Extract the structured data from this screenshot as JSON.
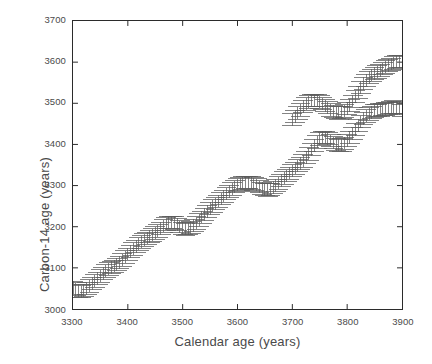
{
  "chart_data": {
    "type": "scatter",
    "title": "",
    "subtitle": "",
    "xlabel": "Calendar age (years)",
    "ylabel": "Carbon-14 age (years)",
    "xlim": [
      3300,
      3900
    ],
    "ylim": [
      3000,
      3700
    ],
    "xticks": [
      3300,
      3400,
      3500,
      3600,
      3700,
      3800,
      3900
    ],
    "yticks": [
      3000,
      3100,
      3200,
      3300,
      3400,
      3500,
      3600,
      3700
    ],
    "xtick_labels": [
      "3300",
      "3400",
      "3500",
      "3600",
      "3700",
      "3800",
      "3900"
    ],
    "ytick_labels": [
      "3000",
      "3100",
      "3200",
      "3300",
      "3400",
      "3500",
      "3600",
      "3700"
    ],
    "grid": false,
    "legend": null,
    "legend_position": "none",
    "marker_style": "errorbar-vertical-capped",
    "series_color": "#5a5a5a",
    "axis_color": "#2b2b2b",
    "background_color": "#ffffff",
    "error_bar_halfwidth_years": 18,
    "sample_spacing_years": 5,
    "series": [
      {
        "name": "Radiocarbon calibration measurements",
        "x": [
          3300,
          3305,
          3310,
          3315,
          3320,
          3325,
          3330,
          3335,
          3340,
          3345,
          3350,
          3355,
          3360,
          3365,
          3370,
          3375,
          3380,
          3385,
          3390,
          3395,
          3400,
          3405,
          3410,
          3415,
          3420,
          3425,
          3430,
          3435,
          3440,
          3445,
          3450,
          3455,
          3460,
          3465,
          3470,
          3475,
          3480,
          3485,
          3490,
          3495,
          3500,
          3505,
          3510,
          3515,
          3520,
          3525,
          3530,
          3535,
          3540,
          3545,
          3550,
          3555,
          3560,
          3565,
          3570,
          3575,
          3580,
          3585,
          3590,
          3595,
          3600,
          3605,
          3610,
          3615,
          3620,
          3625,
          3630,
          3635,
          3640,
          3645,
          3650,
          3655,
          3660,
          3665,
          3670,
          3675,
          3680,
          3685,
          3690,
          3695,
          3700,
          3705,
          3710,
          3715,
          3720,
          3725,
          3730,
          3735,
          3740,
          3745,
          3750,
          3755,
          3760,
          3765,
          3770,
          3775,
          3780,
          3785,
          3790,
          3795,
          3800,
          3805,
          3810,
          3815,
          3820,
          3825,
          3830,
          3835,
          3840,
          3845,
          3850,
          3855,
          3860,
          3865,
          3870,
          3875,
          3880,
          3885,
          3890,
          3895,
          3900
        ],
        "y": [
          3052,
          3048,
          3044,
          3042,
          3045,
          3050,
          3056,
          3062,
          3068,
          3074,
          3080,
          3086,
          3092,
          3097,
          3101,
          3104,
          3108,
          3113,
          3119,
          3126,
          3133,
          3140,
          3146,
          3152,
          3158,
          3163,
          3168,
          3172,
          3176,
          3180,
          3185,
          3190,
          3196,
          3202,
          3207,
          3210,
          3211,
          3209,
          3205,
          3200,
          3196,
          3194,
          3195,
          3198,
          3203,
          3209,
          3216,
          3223,
          3230,
          3237,
          3244,
          3250,
          3256,
          3262,
          3268,
          3274,
          3280,
          3286,
          3292,
          3297,
          3301,
          3304,
          3306,
          3307,
          3307,
          3306,
          3304,
          3301,
          3297,
          3293,
          3290,
          3289,
          3291,
          3295,
          3300,
          3306,
          3312,
          3318,
          3324,
          3330,
          3336,
          3342,
          3348,
          3354,
          3360,
          3368,
          3377,
          3387,
          3397,
          3406,
          3413,
          3417,
          3417,
          3414,
          3409,
          3404,
          3400,
          3398,
          3399,
          3403,
          3409,
          3417,
          3426,
          3436,
          3446,
          3455,
          3463,
          3469,
          3474,
          3478,
          3481,
          3483,
          3484,
          3485,
          3486,
          3488,
          3490,
          3491,
          3490,
          3487,
          3483
        ],
        "yerr": [
          16,
          16,
          16,
          15,
          15,
          15,
          15,
          15,
          15,
          15,
          15,
          15,
          15,
          15,
          15,
          15,
          15,
          15,
          15,
          15,
          15,
          15,
          15,
          15,
          15,
          15,
          15,
          15,
          15,
          15,
          15,
          15,
          15,
          15,
          15,
          15,
          15,
          15,
          15,
          15,
          15,
          15,
          15,
          15,
          15,
          15,
          15,
          15,
          15,
          15,
          15,
          15,
          15,
          15,
          15,
          15,
          15,
          15,
          15,
          15,
          15,
          15,
          15,
          15,
          15,
          15,
          15,
          15,
          15,
          15,
          15,
          15,
          15,
          15,
          15,
          15,
          15,
          15,
          15,
          15,
          15,
          15,
          15,
          15,
          15,
          15,
          15,
          15,
          15,
          15,
          15,
          15,
          15,
          15,
          15,
          15,
          15,
          15,
          15,
          15,
          15,
          15,
          15,
          15,
          15,
          15,
          15,
          15,
          15,
          15,
          15,
          15,
          15,
          15,
          15,
          15,
          15,
          15,
          15,
          15,
          15
        ]
      },
      {
        "name": "Radiocarbon calibration measurements (continued)",
        "x": [
          3700,
          3705,
          3710,
          3715,
          3720,
          3725,
          3730,
          3735,
          3740,
          3745,
          3750,
          3755,
          3760,
          3765,
          3770,
          3775,
          3780,
          3785,
          3790,
          3795,
          3800,
          3805,
          3810,
          3815,
          3820,
          3825,
          3830,
          3835,
          3840,
          3845,
          3850,
          3855,
          3860,
          3865,
          3870,
          3875,
          3880,
          3885,
          3890,
          3895,
          3900
        ],
        "y": [
          3460,
          3468,
          3476,
          3484,
          3492,
          3498,
          3503,
          3506,
          3507,
          3506,
          3503,
          3499,
          3494,
          3489,
          3484,
          3480,
          3477,
          3476,
          3477,
          3481,
          3487,
          3495,
          3505,
          3516,
          3527,
          3538,
          3548,
          3556,
          3563,
          3568,
          3572,
          3576,
          3580,
          3584,
          3588,
          3592,
          3595,
          3598,
          3600,
          3601,
          3602
        ],
        "yerr": [
          15,
          15,
          15,
          15,
          15,
          15,
          15,
          15,
          15,
          15,
          15,
          15,
          15,
          15,
          15,
          15,
          15,
          15,
          15,
          15,
          15,
          15,
          15,
          15,
          15,
          15,
          15,
          15,
          15,
          15,
          15,
          15,
          15,
          15,
          15,
          15,
          15,
          15,
          15,
          15,
          15
        ]
      }
    ]
  },
  "axes": {
    "x_title": "Calendar age (years)",
    "y_title": "Carbon-14 age (years)"
  }
}
